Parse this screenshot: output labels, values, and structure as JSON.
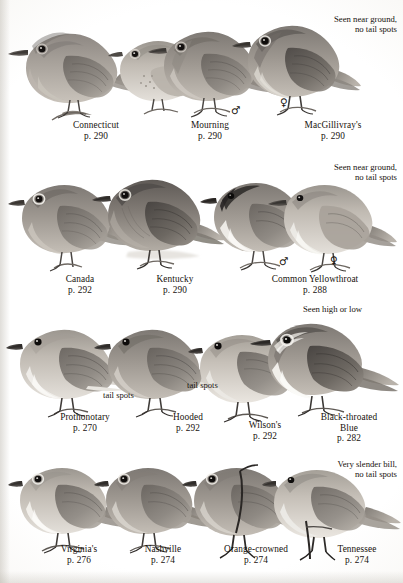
{
  "plate": {
    "title": "Warblers plate",
    "background_color": "#ffffff",
    "ink_color": "#17120d"
  },
  "rows": [
    {
      "id": "row-1",
      "note": {
        "lines": [
          "Seen near ground,",
          "no tail spots"
        ]
      },
      "symbols": [
        {
          "glyph": "♂",
          "name": "male-symbol"
        },
        {
          "glyph": "♀",
          "name": "female-symbol"
        }
      ],
      "birds": [
        {
          "name": "Connecticut",
          "page": "p. 290",
          "tone": "warm-gray"
        },
        {
          "name": "Mourning",
          "page": "p. 290",
          "tone": "pale-gray"
        },
        {
          "name": "MacGillivray's",
          "page": "p. 290",
          "tone": "mid-gray"
        }
      ],
      "captions": [
        {
          "name": "Connecticut",
          "page": "p. 290"
        },
        {
          "name": "Mourning",
          "page": "p. 290"
        },
        {
          "name": "MacGillivray's",
          "page": "p. 290"
        }
      ]
    },
    {
      "id": "row-2",
      "note": {
        "lines": [
          "Seen near ground,",
          "no tail spots"
        ]
      },
      "symbols": [
        {
          "glyph": "♂",
          "name": "male-symbol"
        },
        {
          "glyph": "♀",
          "name": "female-symbol"
        }
      ],
      "birds": [
        {
          "name": "Canada",
          "page": "p. 292",
          "tone": "mid-gray"
        },
        {
          "name": "Kentucky",
          "page": "p. 290",
          "tone": "dark-gray"
        },
        {
          "name": "Common Yellowthroat male",
          "page": "p. 288",
          "tone": "masked"
        },
        {
          "name": "Common Yellowthroat female",
          "page": "p. 288",
          "tone": "pale-gray"
        }
      ],
      "captions": [
        {
          "name": "Canada",
          "page": "p. 292"
        },
        {
          "name": "Kentucky",
          "page": "p. 290"
        },
        {
          "name": "Common Yellowthroat",
          "page": "p. 288"
        }
      ]
    },
    {
      "id": "row-3",
      "note": {
        "lines": [
          "Seen high or low"
        ]
      },
      "labels": [
        {
          "text": "tail spots",
          "name": "tail-spots-label-left"
        },
        {
          "text": "tail spots",
          "name": "tail-spots-label-right"
        }
      ],
      "birds": [
        {
          "name": "Prothonotary",
          "page": "p. 270",
          "tone": "pale-gray"
        },
        {
          "name": "Hooded",
          "page": "p. 292",
          "tone": "mid-gray"
        },
        {
          "name": "Wilson's",
          "page": "p. 292",
          "tone": "light-gray"
        },
        {
          "name": "Black-throated Blue",
          "page": "p. 282",
          "tone": "contrast"
        }
      ],
      "captions": [
        {
          "name": "Prothonotary",
          "page": "p. 270"
        },
        {
          "name": "Hooded",
          "page": "p. 292"
        },
        {
          "name": "Wilson's",
          "page": "p. 292"
        },
        {
          "name": "Black-throated",
          "name2": "Blue",
          "page": "p. 282"
        }
      ]
    },
    {
      "id": "row-4",
      "note": {
        "lines": [
          "Very slender bill,",
          "no tail spots"
        ]
      },
      "birds": [
        {
          "name": "Virginia's",
          "page": "p. 276",
          "tone": "pale-gray"
        },
        {
          "name": "Nashville",
          "page": "p. 274",
          "tone": "mid-gray"
        },
        {
          "name": "Orange-crowned",
          "page": "p. 274",
          "tone": "mid-gray"
        },
        {
          "name": "Tennessee",
          "page": "p. 274",
          "tone": "light-gray"
        }
      ],
      "captions": [
        {
          "name": "Virginia's",
          "page": "p. 276"
        },
        {
          "name": "Nashville",
          "page": "p. 274"
        },
        {
          "name": "Orange-crowned",
          "page": "p. 274"
        },
        {
          "name": "Tennessee",
          "page": "p. 274"
        }
      ]
    }
  ]
}
